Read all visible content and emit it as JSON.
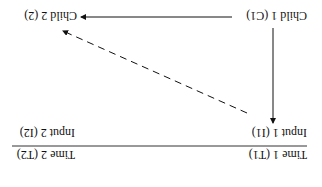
{
  "diagram": {
    "orientation": "rotated 180 degrees",
    "nodes": {
      "time1": "Time 1 (T1)",
      "time2": "Time 2 (T2)",
      "input1": "Input 1 (I1)",
      "input2": "Input 2 (I2)",
      "child1": "Child 1 (C1)",
      "child2": "Child 2 (2)"
    },
    "edges": [
      {
        "from": "child1",
        "to": "input1",
        "style": "solid"
      },
      {
        "from": "child1",
        "to": "child2",
        "style": "solid"
      },
      {
        "from": "input1",
        "to": "child2",
        "style": "dashed"
      }
    ],
    "colors": {
      "ink": "#111111",
      "background": "#ffffff"
    }
  }
}
